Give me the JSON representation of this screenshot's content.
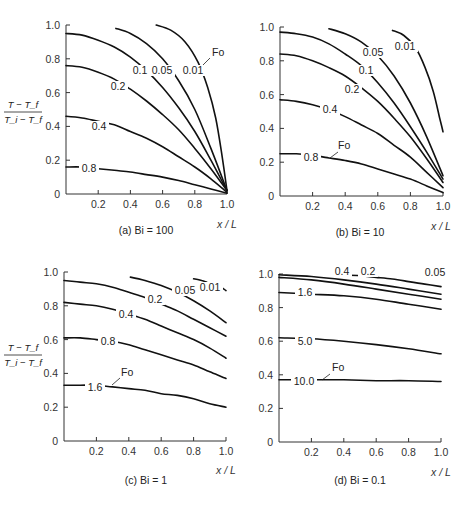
{
  "figure": {
    "y_axis_label_numerator": "T − T_f",
    "y_axis_label_denominator": "T_i − T_f",
    "x_axis_label": "x / L",
    "legend_key": "Fo"
  },
  "chart_data": [
    {
      "type": "line",
      "title": "(a) Bi = 100",
      "xlabel": "x / L",
      "ylabel": "(T − T_f)/(T_i − T_f)",
      "xlim": [
        0,
        1.0
      ],
      "ylim": [
        0,
        1.0
      ],
      "xticks": [
        "0.2",
        "0.4",
        "0.6",
        "0.8",
        "1.0"
      ],
      "yticks": [
        "0",
        "0.2",
        "0.4",
        "0.6",
        "0.8",
        "1.0"
      ],
      "grid": false,
      "series": [
        {
          "name": "Fo = 0.01",
          "label": "0.01",
          "x": [
            0.56,
            0.65,
            0.74,
            0.82,
            0.88,
            0.93,
            0.97,
            1.0
          ],
          "y": [
            1.0,
            0.97,
            0.9,
            0.78,
            0.63,
            0.45,
            0.22,
            0.02
          ]
        },
        {
          "name": "Fo = 0.05",
          "label": "0.05",
          "x": [
            0.31,
            0.4,
            0.5,
            0.6,
            0.7,
            0.8,
            0.9,
            1.0
          ],
          "y": [
            0.98,
            0.95,
            0.89,
            0.8,
            0.67,
            0.5,
            0.27,
            0.02
          ]
        },
        {
          "name": "Fo = 0.1",
          "label": "0.1",
          "x": [
            0.0,
            0.1,
            0.2,
            0.3,
            0.4,
            0.5,
            0.6,
            0.7,
            0.8,
            0.9,
            1.0
          ],
          "y": [
            0.95,
            0.94,
            0.91,
            0.87,
            0.81,
            0.73,
            0.63,
            0.51,
            0.37,
            0.2,
            0.02
          ]
        },
        {
          "name": "Fo = 0.2",
          "label": "0.2",
          "x": [
            0.0,
            0.1,
            0.2,
            0.3,
            0.4,
            0.5,
            0.6,
            0.7,
            0.8,
            0.9,
            1.0
          ],
          "y": [
            0.76,
            0.75,
            0.72,
            0.68,
            0.62,
            0.55,
            0.47,
            0.38,
            0.27,
            0.15,
            0.02
          ]
        },
        {
          "name": "Fo = 0.4",
          "label": "0.4",
          "x": [
            0.0,
            0.1,
            0.2,
            0.3,
            0.4,
            0.5,
            0.6,
            0.7,
            0.8,
            0.9,
            1.0
          ],
          "y": [
            0.46,
            0.45,
            0.43,
            0.41,
            0.37,
            0.33,
            0.28,
            0.22,
            0.16,
            0.09,
            0.01
          ]
        },
        {
          "name": "Fo = 0.8",
          "label": "0.8",
          "x": [
            0.0,
            0.1,
            0.2,
            0.3,
            0.4,
            0.5,
            0.6,
            0.7,
            0.8,
            0.9,
            1.0
          ],
          "y": [
            0.16,
            0.16,
            0.15,
            0.14,
            0.13,
            0.115,
            0.1,
            0.08,
            0.055,
            0.03,
            0.005
          ]
        }
      ]
    },
    {
      "type": "line",
      "title": "(b) Bi = 10",
      "xlabel": "x / L",
      "ylabel": "(T − T_f)/(T_i − T_f)",
      "xlim": [
        0,
        1.0
      ],
      "ylim": [
        0,
        1.0
      ],
      "xticks": [
        "0.2",
        "0.4",
        "0.6",
        "0.8",
        "1.0"
      ],
      "yticks": [
        "0",
        "0.2",
        "0.4",
        "0.6",
        "0.8",
        "1.0"
      ],
      "grid": false,
      "series": [
        {
          "name": "Fo = 0.01",
          "label": "0.01",
          "x": [
            0.69,
            0.76,
            0.83,
            0.89,
            0.94,
            0.98,
            1.0
          ],
          "y": [
            0.98,
            0.95,
            0.88,
            0.76,
            0.62,
            0.46,
            0.38
          ]
        },
        {
          "name": "Fo = 0.05",
          "label": "0.05",
          "x": [
            0.3,
            0.4,
            0.5,
            0.6,
            0.7,
            0.8,
            0.9,
            1.0
          ],
          "y": [
            0.99,
            0.96,
            0.91,
            0.83,
            0.71,
            0.55,
            0.35,
            0.12
          ]
        },
        {
          "name": "Fo = 0.1",
          "label": "0.1",
          "x": [
            0.0,
            0.1,
            0.2,
            0.3,
            0.4,
            0.5,
            0.6,
            0.7,
            0.8,
            0.9,
            1.0
          ],
          "y": [
            0.97,
            0.96,
            0.94,
            0.9,
            0.84,
            0.77,
            0.67,
            0.55,
            0.41,
            0.26,
            0.1
          ]
        },
        {
          "name": "Fo = 0.2",
          "label": "0.2",
          "x": [
            0.0,
            0.1,
            0.2,
            0.3,
            0.4,
            0.5,
            0.6,
            0.7,
            0.8,
            0.9,
            1.0
          ],
          "y": [
            0.84,
            0.83,
            0.8,
            0.76,
            0.71,
            0.64,
            0.56,
            0.46,
            0.35,
            0.22,
            0.08
          ]
        },
        {
          "name": "Fo = 0.4",
          "label": "0.4",
          "x": [
            0.0,
            0.1,
            0.2,
            0.3,
            0.4,
            0.5,
            0.6,
            0.7,
            0.8,
            0.9,
            1.0
          ],
          "y": [
            0.57,
            0.56,
            0.54,
            0.51,
            0.47,
            0.42,
            0.37,
            0.3,
            0.23,
            0.14,
            0.05
          ]
        },
        {
          "name": "Fo = 0.8",
          "label": "0.8",
          "x": [
            0.0,
            0.1,
            0.2,
            0.3,
            0.4,
            0.5,
            0.6,
            0.7,
            0.8,
            0.9,
            1.0
          ],
          "y": [
            0.25,
            0.25,
            0.24,
            0.225,
            0.21,
            0.19,
            0.16,
            0.13,
            0.1,
            0.06,
            0.02
          ]
        }
      ]
    },
    {
      "type": "line",
      "title": "(c) Bi = 1",
      "xlabel": "x / L",
      "ylabel": "(T − T_f)/(T_i − T_f)",
      "xlim": [
        0,
        1.0
      ],
      "ylim": [
        0,
        1.0
      ],
      "xticks": [
        "0.2",
        "0.4",
        "0.6",
        "0.8",
        "1.0"
      ],
      "yticks": [
        "0",
        "0.2",
        "0.4",
        "0.6",
        "0.8",
        "1.0"
      ],
      "grid": false,
      "series": [
        {
          "name": "Fo = 0.01",
          "label": "0.01",
          "x": [
            0.8,
            0.85,
            0.88
          ],
          "y": [
            0.96,
            0.95,
            0.94
          ]
        },
        {
          "name": "Fo = 0.01 (tail)",
          "label": "",
          "x": [
            0.97,
            1.0
          ],
          "y": [
            0.91,
            0.89
          ]
        },
        {
          "name": "Fo = 0.05",
          "label": "0.05",
          "x": [
            0.41,
            0.5,
            0.6,
            0.7,
            0.8,
            0.9,
            1.0
          ],
          "y": [
            0.97,
            0.95,
            0.92,
            0.88,
            0.83,
            0.77,
            0.7
          ]
        },
        {
          "name": "Fo = 0.2",
          "label": "0.2",
          "x": [
            0.0,
            0.1,
            0.2,
            0.3,
            0.4,
            0.5,
            0.6,
            0.7,
            0.8,
            0.9,
            1.0
          ],
          "y": [
            0.95,
            0.94,
            0.93,
            0.91,
            0.88,
            0.85,
            0.81,
            0.77,
            0.72,
            0.67,
            0.62
          ]
        },
        {
          "name": "Fo = 0.4",
          "label": "0.4",
          "x": [
            0.0,
            0.1,
            0.2,
            0.3,
            0.4,
            0.5,
            0.6,
            0.7,
            0.8,
            0.9,
            1.0
          ],
          "y": [
            0.82,
            0.81,
            0.8,
            0.78,
            0.75,
            0.72,
            0.68,
            0.64,
            0.6,
            0.55,
            0.49
          ]
        },
        {
          "name": "Fo = 0.8",
          "label": "0.8",
          "x": [
            0.0,
            0.1,
            0.2,
            0.3,
            0.4,
            0.5,
            0.6,
            0.7,
            0.8,
            0.9,
            1.0
          ],
          "y": [
            0.61,
            0.61,
            0.6,
            0.59,
            0.57,
            0.54,
            0.51,
            0.48,
            0.45,
            0.41,
            0.37
          ]
        },
        {
          "name": "Fo = 1.6",
          "label": "1.6",
          "x": [
            0.0,
            0.1,
            0.2,
            0.3,
            0.4,
            0.5,
            0.6,
            0.7,
            0.8,
            0.9,
            1.0
          ],
          "y": [
            0.33,
            0.33,
            0.33,
            0.32,
            0.31,
            0.3,
            0.28,
            0.27,
            0.25,
            0.22,
            0.2
          ]
        }
      ]
    },
    {
      "type": "line",
      "title": "(d) Bi = 0.1",
      "xlabel": "x / L",
      "ylabel": "(T − T_f)/(T_i − T_f)",
      "xlim": [
        0,
        1.0
      ],
      "ylim": [
        0,
        1.0
      ],
      "xticks": [
        "0.2",
        "0.4",
        "0.6",
        "0.8",
        "1.0"
      ],
      "yticks": [
        "0",
        "0.2",
        "0.4",
        "0.6",
        "0.8",
        "1.0"
      ],
      "grid": false,
      "series": [
        {
          "name": "Fo = 0.05",
          "label": "0.05",
          "x": [
            0.35,
            0.5,
            0.6,
            0.7,
            0.8,
            0.9,
            1.0
          ],
          "y": [
            0.995,
            0.99,
            0.98,
            0.97,
            0.955,
            0.94,
            0.925
          ]
        },
        {
          "name": "Fo = 0.2",
          "label": "0.2",
          "x": [
            0.0,
            0.2,
            0.4,
            0.6,
            0.8,
            1.0
          ],
          "y": [
            0.995,
            0.985,
            0.965,
            0.94,
            0.91,
            0.88
          ]
        },
        {
          "name": "Fo = 0.4",
          "label": "0.4",
          "x": [
            0.0,
            0.2,
            0.4,
            0.6,
            0.8,
            1.0
          ],
          "y": [
            0.98,
            0.965,
            0.94,
            0.91,
            0.88,
            0.85
          ]
        },
        {
          "name": "Fo = 1.6",
          "label": "1.6",
          "x": [
            0.0,
            0.2,
            0.4,
            0.6,
            0.8,
            1.0
          ],
          "y": [
            0.89,
            0.88,
            0.87,
            0.85,
            0.82,
            0.79
          ]
        },
        {
          "name": "Fo = 5.0",
          "label": "5.0",
          "x": [
            0.0,
            0.2,
            0.4,
            0.6,
            0.8,
            1.0
          ],
          "y": [
            0.62,
            0.615,
            0.6,
            0.58,
            0.555,
            0.525
          ]
        },
        {
          "name": "Fo = 10.0",
          "label": "10.0",
          "x": [
            0.0,
            0.2,
            0.4,
            0.6,
            0.8,
            1.0
          ],
          "y": [
            0.37,
            0.37,
            0.37,
            0.365,
            0.365,
            0.36
          ]
        }
      ]
    }
  ],
  "panels": [
    {
      "box": {
        "x0": 66,
        "x1": 227,
        "y0": 194,
        "y1": 25
      },
      "show_ylabel": true,
      "ylabel_pos": {
        "x": 23,
        "y": 112
      },
      "caption_pos": {
        "x": 146,
        "y": 234
      },
      "xlab_pos": {
        "x": 227,
        "y": 220
      },
      "labels": [
        {
          "text": "0.1",
          "x": 140,
          "y": 74,
          "gap": [
            135,
            152
          ]
        },
        {
          "text": "0.05",
          "x": 162,
          "y": 74,
          "gap": [
            0,
            0
          ]
        },
        {
          "text": "0.01",
          "x": 193,
          "y": 74,
          "gap": [
            0,
            0
          ]
        },
        {
          "text": "0.2",
          "x": 118,
          "y": 90,
          "gap": [
            0,
            0
          ]
        },
        {
          "text": "0.4",
          "x": 99,
          "y": 130,
          "gap": [
            0,
            0
          ]
        },
        {
          "text": "0.8",
          "x": 89,
          "y": 172,
          "gap": [
            0,
            0
          ]
        }
      ],
      "fo": {
        "text": "Fo",
        "x": 212,
        "y": 56,
        "lx1": 210,
        "ly1": 58,
        "lx2": 203,
        "ly2": 65
      }
    },
    {
      "box": {
        "x0": 280,
        "x1": 443,
        "y0": 196,
        "y1": 27
      },
      "show_ylabel": false,
      "caption_pos": {
        "x": 360,
        "y": 236
      },
      "xlab_pos": {
        "x": 441,
        "y": 222
      },
      "labels": [
        {
          "text": "0.05",
          "x": 373,
          "y": 56
        },
        {
          "text": "0.01",
          "x": 405,
          "y": 50
        },
        {
          "text": "0.1",
          "x": 366,
          "y": 74
        },
        {
          "text": "0.2",
          "x": 352,
          "y": 93
        },
        {
          "text": "0.4",
          "x": 330,
          "y": 113
        },
        {
          "text": "0.8",
          "x": 311,
          "y": 161
        }
      ],
      "fo": {
        "text": "Fo",
        "x": 338,
        "y": 149,
        "lx1": 338,
        "ly1": 152,
        "lx2": 330,
        "ly2": 158
      }
    },
    {
      "box": {
        "x0": 64,
        "x1": 226,
        "y0": 441,
        "y1": 272
      },
      "show_ylabel": true,
      "ylabel_pos": {
        "x": 23,
        "y": 355
      },
      "caption_pos": {
        "x": 146,
        "y": 484
      },
      "xlab_pos": {
        "x": 226,
        "y": 466
      },
      "labels": [
        {
          "text": "0.05",
          "x": 185,
          "y": 294
        },
        {
          "text": "0.01",
          "x": 210,
          "y": 291
        },
        {
          "text": "0.2",
          "x": 155,
          "y": 303
        },
        {
          "text": "0.4",
          "x": 126,
          "y": 318
        },
        {
          "text": "0.8",
          "x": 108,
          "y": 345
        },
        {
          "text": "1.6",
          "x": 95,
          "y": 391
        }
      ],
      "fo": {
        "text": "Fo",
        "x": 121,
        "y": 376,
        "lx1": 120,
        "ly1": 378,
        "lx2": 112,
        "ly2": 385
      }
    },
    {
      "box": {
        "x0": 279,
        "x1": 441,
        "y0": 442,
        "y1": 274
      },
      "show_ylabel": false,
      "caption_pos": {
        "x": 360,
        "y": 484
      },
      "xlab_pos": {
        "x": 441,
        "y": 468
      },
      "labels": [
        {
          "text": "0.4",
          "x": 342,
          "y": 275
        },
        {
          "text": "0.2",
          "x": 368,
          "y": 275
        },
        {
          "text": "0.05",
          "x": 435,
          "y": 276
        },
        {
          "text": "1.6",
          "x": 305,
          "y": 296
        },
        {
          "text": "5.0",
          "x": 305,
          "y": 345
        },
        {
          "text": "10.0",
          "x": 304,
          "y": 385
        }
      ],
      "fo": {
        "text": "Fo",
        "x": 332,
        "y": 371,
        "lx1": 330,
        "ly1": 374,
        "lx2": 322,
        "ly2": 380
      }
    }
  ]
}
